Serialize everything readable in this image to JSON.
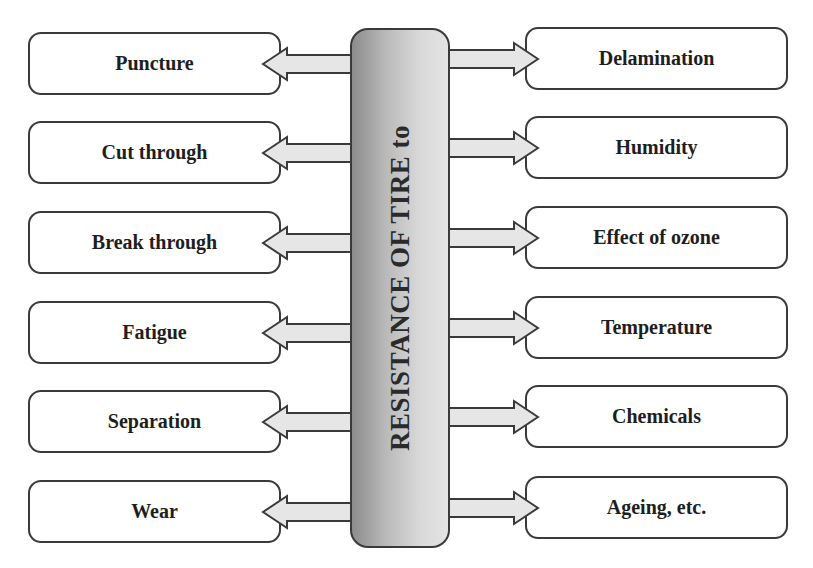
{
  "center": {
    "label": "RESISTANCE OF TIRE to"
  },
  "left_items": [
    {
      "label": "Puncture",
      "top": 32
    },
    {
      "label": "Cut through",
      "top": 121
    },
    {
      "label": "Break through",
      "top": 211
    },
    {
      "label": "Fatigue",
      "top": 301
    },
    {
      "label": "Separation",
      "top": 390
    },
    {
      "label": "Wear",
      "top": 480
    }
  ],
  "right_items": [
    {
      "label": "Delamination",
      "top": 27
    },
    {
      "label": "Humidity",
      "top": 116
    },
    {
      "label": "Effect of ozone",
      "top": 206
    },
    {
      "label": "Temperature",
      "top": 296
    },
    {
      "label": "Chemicals",
      "top": 385
    },
    {
      "label": "Ageing, etc.",
      "top": 476
    }
  ],
  "colors": {
    "border": "#3a3a3a",
    "arrow_fill": "#e6e6e6",
    "pill_dark": "#8c8c8c",
    "pill_light": "#e4e4e4"
  }
}
